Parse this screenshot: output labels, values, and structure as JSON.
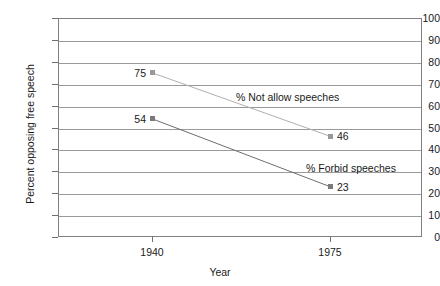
{
  "chart_data": {
    "type": "line",
    "title": "",
    "xlabel": "Year",
    "ylabel": "Percent opposing free speech",
    "x": [
      1940,
      1975
    ],
    "categories": [
      "1940",
      "1975"
    ],
    "xtick_labels": [
      "1940",
      "1975"
    ],
    "ytick_labels": [
      "0",
      "10",
      "20",
      "30",
      "40",
      "50",
      "60",
      "70",
      "80",
      "90",
      "100"
    ],
    "ytick_values": [
      0,
      10,
      20,
      30,
      40,
      50,
      60,
      70,
      80,
      90,
      100
    ],
    "ylim": [
      0,
      100
    ],
    "grid": "horizontal",
    "legend": "none",
    "series": [
      {
        "name": "% Not allow speeches",
        "values": [
          75,
          46
        ],
        "color": "#b0b0b0",
        "marker_color": "#999999",
        "labels": [
          "75",
          "46"
        ]
      },
      {
        "name": "% Forbid speeches",
        "values": [
          54,
          23
        ],
        "color": "#6e6e6e",
        "marker_color": "#7a7a7a",
        "labels": [
          "54",
          "23"
        ]
      }
    ],
    "annotations": [
      {
        "text": "% Not allow speeches",
        "x_px": 236,
        "y_px": 97
      },
      {
        "text": "% Forbid speeches",
        "x_px": 306,
        "y_px": 168
      }
    ]
  }
}
